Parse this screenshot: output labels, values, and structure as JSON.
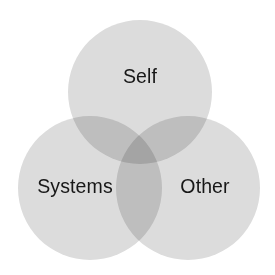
{
  "diagram": {
    "type": "venn",
    "background_color": "#ffffff",
    "circle_fill_color": "#dcdcdc",
    "pair_overlap_color": "#c8c8c8",
    "triple_overlap_color": "#b4b4b4",
    "label_color": "#171717",
    "circles": [
      {
        "id": "self",
        "label": "Self",
        "cx": 140,
        "cy": 92,
        "r": 72,
        "label_x": 140,
        "label_y": 78
      },
      {
        "id": "systems",
        "label": "Systems",
        "cx": 90,
        "cy": 188,
        "r": 72,
        "label_x": 75,
        "label_y": 188
      },
      {
        "id": "other",
        "label": "Other",
        "cx": 188,
        "cy": 188,
        "r": 72,
        "label_x": 205,
        "label_y": 188
      }
    ]
  }
}
